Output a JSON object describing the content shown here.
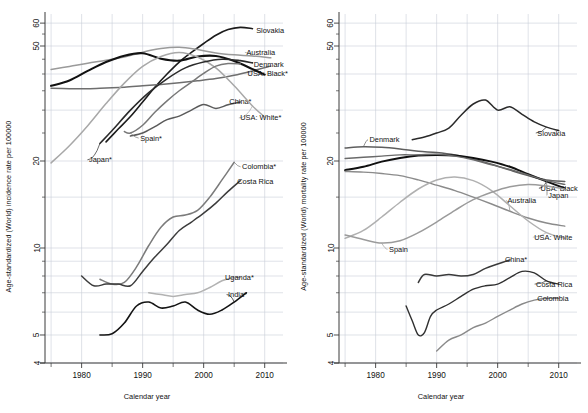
{
  "figure": {
    "type": "multi-panel-line-chart",
    "panels": 2,
    "xlabel": "Calendar year"
  },
  "panels": [
    {
      "id": "incidence",
      "ylabel": "Age-standardized (World) incidence rate per 100000",
      "xlabel": "Calendar year",
      "xticks": [
        "1980",
        "1990",
        "2000",
        "2010"
      ],
      "yticks": [
        "60",
        "50",
        "20",
        "10",
        "5",
        "4"
      ]
    },
    {
      "id": "mortality",
      "ylabel": "Age-standardized (World) mortality rate per 100000",
      "xlabel": "Calendar year",
      "xticks": [
        "1980",
        "1990",
        "2000",
        "2010"
      ],
      "yticks": [
        "60",
        "50",
        "20",
        "10",
        "5",
        "4"
      ]
    }
  ],
  "chart_data": [
    {
      "type": "line",
      "title": "",
      "xlabel": "Calendar year",
      "ylabel": "Age-standardized (World) incidence rate per 100000",
      "yscale": "log",
      "ylim": [
        3.8,
        65
      ],
      "xlim": [
        1974,
        2013
      ],
      "ytick_values": [
        4,
        5,
        10,
        20,
        50,
        60
      ],
      "ytick_labels": [
        "4",
        "5",
        "10",
        "20",
        "50",
        "60"
      ],
      "xtick_values": [
        1980,
        1990,
        2000,
        2010
      ],
      "xtick_labels": [
        "1980",
        "1990",
        "2000",
        "2010"
      ],
      "grid": true,
      "legend": "inline-line-labels",
      "series": [
        {
          "name": "Slovakia",
          "color": "#1c1c1c",
          "width": 1.6,
          "label_xy": [
            2008.6,
            56.5
          ],
          "x": [
            1984,
            1986,
            1988,
            1990,
            1992,
            1994,
            1996,
            1998,
            2000,
            2002,
            2004,
            2006,
            2008
          ],
          "y": [
            23.3,
            25.8,
            28.5,
            32.0,
            36.0,
            40.0,
            44.0,
            47.5,
            51.0,
            54.5,
            57.0,
            58.0,
            57.4
          ]
        },
        {
          "name": "Australia",
          "color": "#9a9a9a",
          "width": 1.5,
          "label_xy": [
            2007.0,
            47.5
          ],
          "x": [
            1975,
            1978,
            1981,
            1984,
            1987,
            1990,
            1993,
            1996,
            1999,
            2002,
            2005,
            2008,
            2011
          ],
          "y": [
            41.5,
            42.5,
            43.6,
            44.6,
            45.8,
            47.6,
            49.0,
            49.5,
            48.6,
            47.3,
            46.6,
            46.2,
            45.5
          ]
        },
        {
          "name": "Denmark",
          "color": "#6e6e6e",
          "width": 1.5,
          "label_xy": [
            2008.2,
            43.3
          ],
          "x": [
            1975,
            1978,
            1981,
            1984,
            1987,
            1990,
            1993,
            1996,
            1999,
            2002,
            2005,
            2008,
            2011
          ],
          "y": [
            35.7,
            35.6,
            35.6,
            35.8,
            36.0,
            36.4,
            36.8,
            37.3,
            37.9,
            38.6,
            39.6,
            41.0,
            42.6
          ]
        },
        {
          "name": "USA: Black*",
          "color": "#111111",
          "width": 2.1,
          "label_xy": [
            2007.2,
            40.3
          ],
          "x": [
            1975,
            1978,
            1981,
            1984,
            1987,
            1990,
            1993,
            1996,
            1999,
            2002,
            2005,
            2008,
            2010
          ],
          "y": [
            36.4,
            38.0,
            41.0,
            44.0,
            46.3,
            47.2,
            45.2,
            44.5,
            46.0,
            46.2,
            44.4,
            41.6,
            39.8
          ]
        },
        {
          "name": "China*",
          "color": "#5a5a5a",
          "width": 1.5,
          "label_xy": [
            2004.2,
            32.2
          ],
          "x": [
            1988,
            1990,
            1992,
            1994,
            1996,
            1998,
            2000,
            2002,
            2004,
            2006
          ],
          "y": [
            24.4,
            25.0,
            26.3,
            27.8,
            28.6,
            30.0,
            31.4,
            30.4,
            31.3,
            32.0
          ]
        },
        {
          "name": "USA: White*",
          "color": "#a8a8a8",
          "width": 1.5,
          "label_xy": [
            2006.0,
            28.2
          ],
          "x": [
            1975,
            1978,
            1981,
            1984,
            1987,
            1990,
            1993,
            1996,
            1999,
            2002,
            2005,
            2008,
            2010
          ],
          "y": [
            19.7,
            22.6,
            26.5,
            31.6,
            37.2,
            42.5,
            46.0,
            47.5,
            45.8,
            42.0,
            36.4,
            31.0,
            28.4
          ]
        },
        {
          "name": "Spain*",
          "color": "#787878",
          "width": 1.5,
          "label_xy": [
            1989.6,
            24.0
          ],
          "x": [
            1987,
            1988,
            1990,
            1992,
            1994,
            1996,
            1998,
            2000,
            2002,
            2004,
            2006
          ],
          "y": [
            25.3,
            25.0,
            26.6,
            29.5,
            32.3,
            35.0,
            37.5,
            40.2,
            42.6,
            43.5,
            43.3
          ]
        },
        {
          "name": "Japan*",
          "color": "#2b2b2b",
          "width": 1.6,
          "label_xy": [
            1981.2,
            20.2
          ],
          "x": [
            1983,
            1985,
            1988,
            1991,
            1994,
            1997,
            2000,
            2003,
            2006,
            2008
          ],
          "y": [
            23.0,
            25.5,
            30.0,
            34.5,
            38.5,
            42.0,
            44.0,
            45.0,
            44.5,
            43.7
          ]
        },
        {
          "name": "Colombia*",
          "color": "#7b7b7b",
          "width": 1.5,
          "label_xy": [
            2006.3,
            19.1
          ],
          "x": [
            1983,
            1985,
            1987,
            1989,
            1991,
            1993,
            1995,
            1997,
            1999,
            2001,
            2003,
            2005
          ],
          "y": [
            7.8,
            7.5,
            7.6,
            8.6,
            10.2,
            11.8,
            12.8,
            13.0,
            13.5,
            15.0,
            17.2,
            19.8
          ]
        },
        {
          "name": "Costa Rica",
          "color": "#3c3c3c",
          "width": 1.5,
          "label_xy": [
            2005.5,
            17.0
          ],
          "x": [
            1980,
            1982,
            1984,
            1986,
            1988,
            1990,
            1992,
            1994,
            1996,
            1998,
            2000,
            2002,
            2004,
            2006
          ],
          "y": [
            8.0,
            7.4,
            7.5,
            7.5,
            7.4,
            8.3,
            9.3,
            10.3,
            11.5,
            12.3,
            13.2,
            14.3,
            15.7,
            17.1
          ]
        },
        {
          "name": "Uganda*",
          "color": "#b2b2b2",
          "width": 1.5,
          "label_xy": [
            2003.5,
            7.9
          ],
          "x": [
            1991,
            1993,
            1995,
            1997,
            1999,
            2001,
            2003,
            2005,
            2006
          ],
          "y": [
            7.0,
            6.9,
            6.8,
            6.9,
            7.0,
            7.3,
            7.7,
            7.9,
            7.9
          ]
        },
        {
          "name": "India*",
          "color": "#141414",
          "width": 1.6,
          "label_xy": [
            2004.0,
            6.9
          ],
          "x": [
            1983,
            1985,
            1987,
            1989,
            1991,
            1993,
            1995,
            1997,
            1999,
            2001,
            2003,
            2005,
            2007
          ],
          "y": [
            5.0,
            5.05,
            5.5,
            6.3,
            6.5,
            6.2,
            6.3,
            6.5,
            6.1,
            5.9,
            6.1,
            6.5,
            7.0
          ]
        }
      ]
    },
    {
      "type": "line",
      "title": "",
      "xlabel": "Calendar year",
      "ylabel": "Age-standardized (World) mortality rate per 100000",
      "yscale": "log",
      "ylim": [
        3.8,
        65
      ],
      "xlim": [
        1974,
        2013
      ],
      "ytick_values": [
        4,
        5,
        10,
        20,
        50,
        60
      ],
      "ytick_labels": [
        "4",
        "5",
        "10",
        "20",
        "50",
        "60"
      ],
      "xtick_values": [
        1980,
        1990,
        2000,
        2010
      ],
      "xtick_labels": [
        "1980",
        "1990",
        "2000",
        "2010"
      ],
      "grid": true,
      "legend": "inline-line-labels",
      "series": [
        {
          "name": "Slovakia",
          "color": "#2a2a2a",
          "width": 1.5,
          "label_xy": [
            2006.5,
            25.0
          ],
          "x": [
            1986,
            1988,
            1990,
            1992,
            1994,
            1996,
            1998,
            2000,
            2002,
            2004,
            2006,
            2008,
            2010
          ],
          "y": [
            23.7,
            24.2,
            25.0,
            26.0,
            28.8,
            31.5,
            32.5,
            30.0,
            30.8,
            29.0,
            27.3,
            26.2,
            25.5
          ]
        },
        {
          "name": "Denmark",
          "color": "#5e5e5e",
          "width": 1.5,
          "label_xy": [
            1979.0,
            23.7
          ],
          "x": [
            1975,
            1978,
            1981,
            1984,
            1987,
            1990,
            1993,
            1996,
            1999,
            2002,
            2005,
            2008,
            2011
          ],
          "y": [
            22.2,
            22.4,
            22.3,
            22.0,
            21.6,
            21.4,
            21.0,
            20.3,
            19.5,
            18.6,
            17.8,
            17.2,
            17.0
          ]
        },
        {
          "name": "USA: Black",
          "color": "#101010",
          "width": 2.0,
          "label_xy": [
            2007.0,
            16.1
          ],
          "x": [
            1975,
            1978,
            1981,
            1984,
            1987,
            1990,
            1993,
            1996,
            1999,
            2002,
            2005,
            2008,
            2011
          ],
          "y": [
            18.6,
            19.1,
            19.9,
            20.5,
            20.9,
            21.0,
            20.9,
            20.5,
            19.9,
            19.1,
            18.0,
            17.0,
            16.1
          ]
        },
        {
          "name": "Japan",
          "color": "#6a6a6a",
          "width": 1.4,
          "label_xy": [
            2008.3,
            15.2
          ],
          "x": [
            1975,
            1978,
            1981,
            1984,
            1987,
            1990,
            1993,
            1996,
            1999,
            2002,
            2005,
            2008,
            2011
          ],
          "y": [
            20.4,
            20.6,
            20.8,
            21.0,
            21.0,
            21.1,
            20.8,
            20.2,
            19.4,
            18.7,
            17.9,
            17.1,
            16.6
          ]
        },
        {
          "name": "Australia",
          "color": "#8b8b8b",
          "width": 1.4,
          "label_xy": [
            2001.6,
            14.6
          ],
          "x": [
            1975,
            1978,
            1981,
            1984,
            1987,
            1990,
            1993,
            1996,
            1999,
            2002,
            2005,
            2008,
            2011
          ],
          "y": [
            18.4,
            18.3,
            18.1,
            17.8,
            17.2,
            16.5,
            15.8,
            15.0,
            14.2,
            13.4,
            12.7,
            12.2,
            11.9
          ]
        },
        {
          "name": "USA: White",
          "color": "#b0b0b0",
          "width": 1.5,
          "label_xy": [
            2006.0,
            10.9
          ],
          "x": [
            1975,
            1978,
            1981,
            1984,
            1987,
            1990,
            1993,
            1996,
            1999,
            2002,
            2005,
            2008,
            2011
          ],
          "y": [
            10.8,
            11.5,
            12.8,
            14.4,
            16.0,
            17.2,
            17.6,
            17.1,
            15.8,
            14.0,
            12.4,
            11.3,
            10.8
          ]
        },
        {
          "name": "Spain",
          "color": "#9b9b9b",
          "width": 1.5,
          "label_xy": [
            1982.2,
            9.9
          ],
          "x": [
            1975,
            1978,
            1981,
            1984,
            1987,
            1990,
            1993,
            1996,
            1999,
            2002,
            2005,
            2008,
            2011
          ],
          "y": [
            11.1,
            10.7,
            10.4,
            10.6,
            11.3,
            12.3,
            13.5,
            14.7,
            15.6,
            16.3,
            16.6,
            16.4,
            16.0
          ]
        },
        {
          "name": "China*",
          "color": "#3a3a3a",
          "width": 1.5,
          "label_xy": [
            2001.2,
            9.1
          ],
          "x": [
            1987,
            1988,
            1990,
            1992,
            1994,
            1996,
            1998,
            2000,
            2002
          ],
          "y": [
            7.6,
            8.1,
            8.0,
            8.1,
            8.0,
            8.1,
            8.5,
            8.8,
            9.1
          ]
        },
        {
          "name": "Costa Rica",
          "color": "#303030",
          "width": 1.4,
          "label_xy": [
            2006.3,
            7.5
          ],
          "x": [
            1985,
            1986,
            1987,
            1988,
            1989,
            1990,
            1992,
            1994,
            1996,
            1998,
            2000,
            2002,
            2004,
            2006,
            2008,
            2010
          ],
          "y": [
            6.3,
            5.6,
            5.0,
            5.1,
            5.8,
            6.1,
            6.4,
            6.8,
            7.2,
            7.4,
            7.5,
            7.9,
            8.3,
            8.2,
            7.7,
            7.5
          ]
        },
        {
          "name": "Colombia",
          "color": "#8a8a8a",
          "width": 1.4,
          "label_xy": [
            2006.5,
            6.7
          ],
          "x": [
            1990,
            1992,
            1994,
            1996,
            1998,
            2000,
            2002,
            2004,
            2006,
            2008,
            2010
          ],
          "y": [
            4.4,
            4.8,
            5.0,
            5.3,
            5.5,
            5.8,
            6.1,
            6.4,
            6.6,
            6.7,
            6.7
          ]
        }
      ]
    }
  ]
}
